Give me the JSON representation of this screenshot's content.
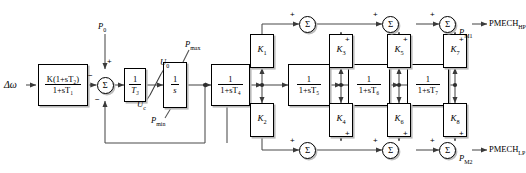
{
  "diagram": {
    "input": {
      "label": "Δω"
    },
    "setpoint": {
      "label": "P",
      "sub": "0",
      "sign": "+"
    },
    "outputs": [
      {
        "name": "PMECH_HP",
        "text": "PMECH",
        "sub": "HP",
        "node_label": "P",
        "node_sub": "M1"
      },
      {
        "name": "PMECH_LP",
        "text": "PMECH",
        "sub": "LP",
        "node_label": "P",
        "node_sub": "M2"
      }
    ],
    "blocks": [
      {
        "id": "governor",
        "type": "transfer",
        "num": "K(1+sT₂)",
        "den": "1+sT₁"
      },
      {
        "id": "gain_t3",
        "type": "transfer",
        "num": "1",
        "den": "T₃"
      },
      {
        "id": "integrator",
        "type": "transfer",
        "num": "1",
        "den": "s"
      },
      {
        "id": "lag_t4",
        "type": "transfer",
        "num": "1",
        "den": "1+sT₄"
      },
      {
        "id": "lag_t5",
        "type": "transfer",
        "num": "1",
        "den": "1+sT₅"
      },
      {
        "id": "lag_t6",
        "type": "transfer",
        "num": "1",
        "den": "1+sT₆"
      },
      {
        "id": "lag_t7",
        "type": "transfer",
        "num": "1",
        "den": "1+sT₇"
      }
    ],
    "gains": [
      {
        "id": "k1",
        "label": "K",
        "sub": "1",
        "row": "top"
      },
      {
        "id": "k3",
        "label": "K",
        "sub": "3",
        "row": "top"
      },
      {
        "id": "k5",
        "label": "K",
        "sub": "5",
        "row": "top"
      },
      {
        "id": "k7",
        "label": "K",
        "sub": "7",
        "row": "top"
      },
      {
        "id": "k2",
        "label": "K",
        "sub": "2",
        "row": "bottom"
      },
      {
        "id": "k4",
        "label": "K",
        "sub": "4",
        "row": "bottom"
      },
      {
        "id": "k6",
        "label": "K",
        "sub": "6",
        "row": "bottom"
      },
      {
        "id": "k8",
        "label": "K",
        "sub": "8",
        "row": "bottom"
      }
    ],
    "limits": {
      "rate_upper": {
        "label": "U",
        "sub": "0"
      },
      "rate_lower": {
        "label": "U",
        "sub": "c"
      },
      "pos_upper": {
        "label": "P",
        "sub": "max"
      },
      "pos_lower": {
        "label": "P",
        "sub": "min"
      }
    },
    "summers": {
      "glyph": "Σ",
      "input_summer_signs": {
        "top": "+",
        "left": "−",
        "bottom": "−"
      },
      "top_row_signs": {
        "left": "+",
        "bottom": "+"
      },
      "bottom_row_signs": {
        "left": "+",
        "top": "+"
      }
    },
    "signs": {
      "plus": "+",
      "minus": "−"
    },
    "colors": {
      "line": "#404040",
      "stroke": "#000000",
      "background": "#ffffff",
      "shadow": "#bdbdbd"
    }
  }
}
